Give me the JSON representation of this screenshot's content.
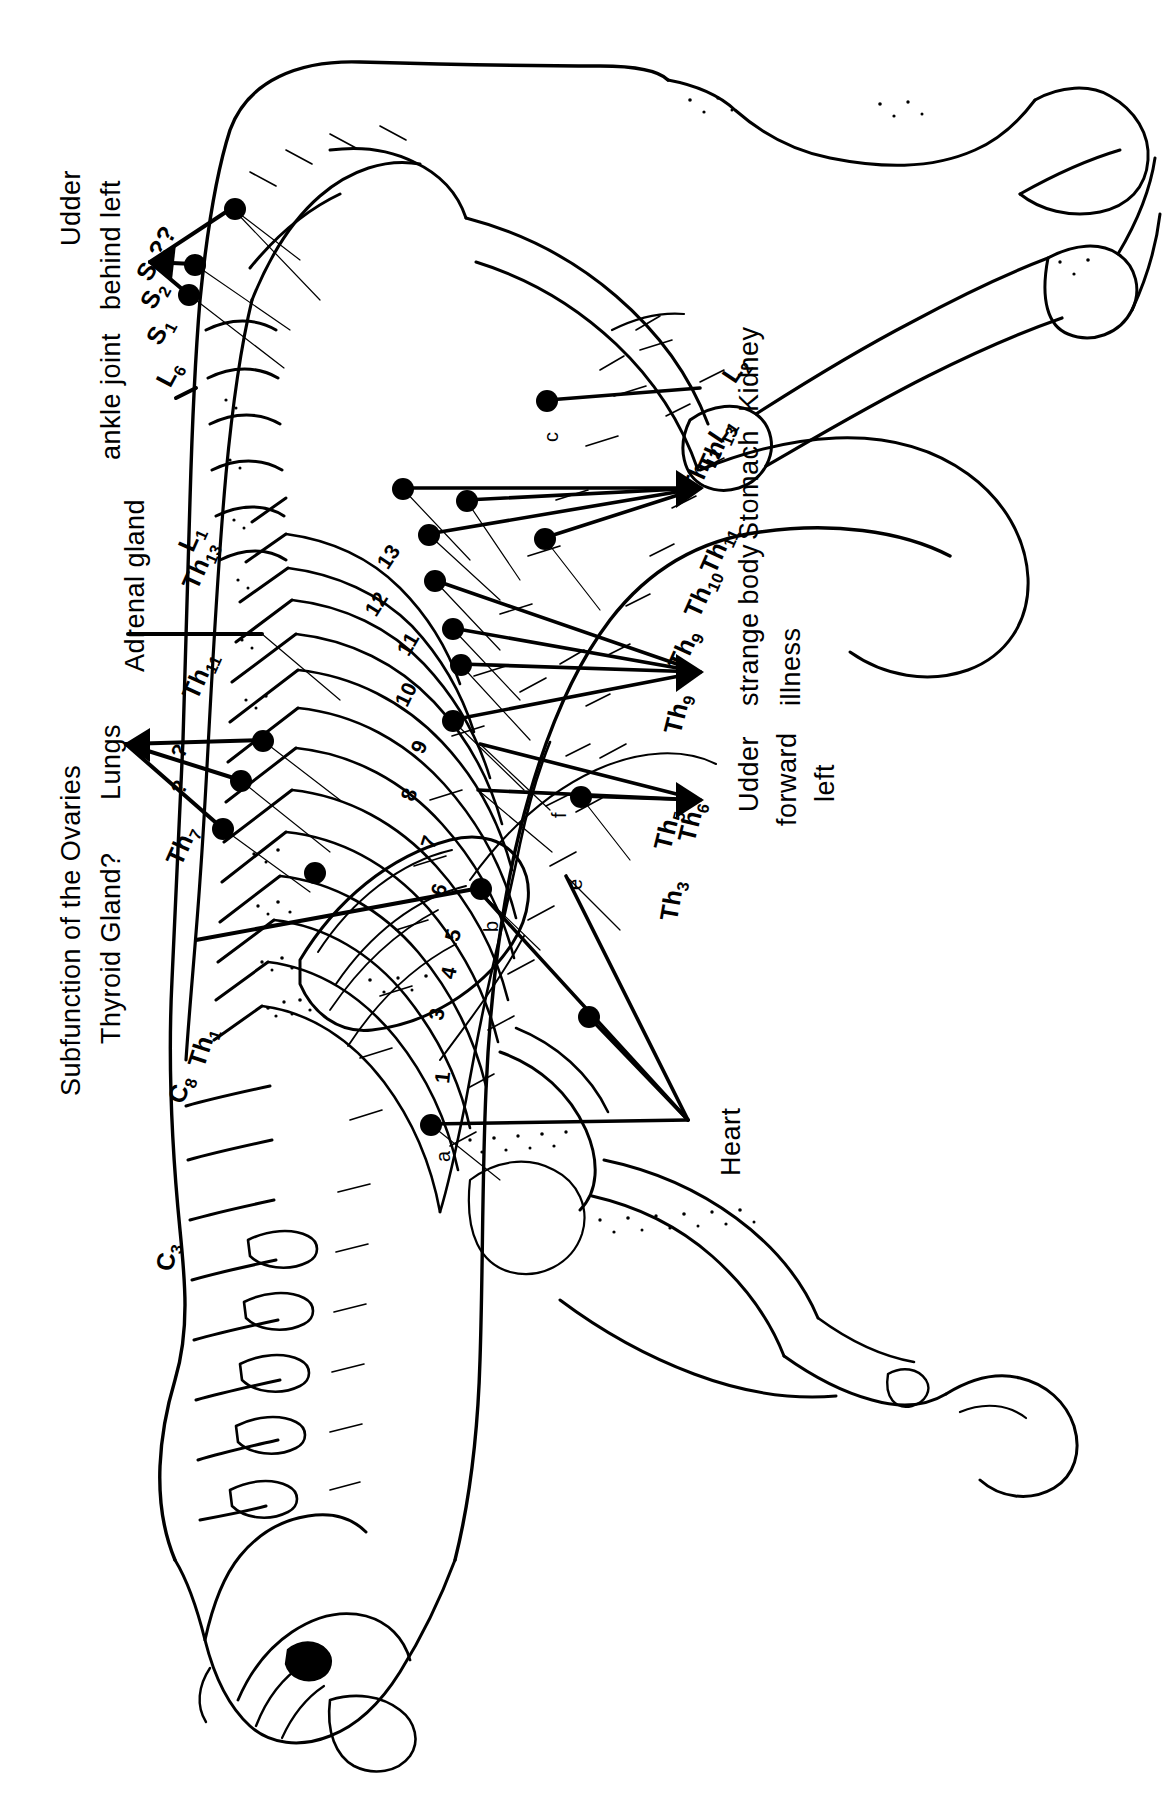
{
  "figure": {
    "orientation": "labels rotated 90 degrees counter-clockwise",
    "ink_color": "#000000",
    "background_color": "#ffffff"
  },
  "organ_labels": [
    {
      "id": "udder-behind-left",
      "text": "Udder\nbehind  left",
      "line1": "Udder",
      "line2": "behind  left"
    },
    {
      "id": "ankle-joint",
      "text": "ankle joint"
    },
    {
      "id": "adrenal-gland",
      "text": "Adrenal gland"
    },
    {
      "id": "lungs",
      "text": "Lungs"
    },
    {
      "id": "subfunction-ovaries",
      "text": "Subfunction of the Ovaries"
    },
    {
      "id": "thyroid-gland",
      "text": "Thyroid Gland?"
    },
    {
      "id": "kidney",
      "text": "Kidney"
    },
    {
      "id": "stomach",
      "text": "Stomach"
    },
    {
      "id": "strange-body",
      "text": "strange body"
    },
    {
      "id": "illness",
      "text": "illness"
    },
    {
      "id": "udder-forward",
      "text": "Udder"
    },
    {
      "id": "forward",
      "text": "forward"
    },
    {
      "id": "left",
      "text": "left"
    },
    {
      "id": "heart",
      "text": "Heart"
    }
  ],
  "segment_labels": [
    {
      "id": "c3",
      "base": "C",
      "sub": "3"
    },
    {
      "id": "c8",
      "base": "C",
      "sub": "8"
    },
    {
      "id": "th1",
      "base": "Th",
      "sub": "1"
    },
    {
      "id": "th3",
      "base": "Th",
      "sub": "3"
    },
    {
      "id": "th4",
      "base": "Th",
      "sub": "4"
    },
    {
      "id": "th5",
      "base": "Th",
      "sub": "5"
    },
    {
      "id": "th6",
      "base": "Th",
      "sub": "6"
    },
    {
      "id": "th7",
      "base": "Th",
      "sub": "7"
    },
    {
      "id": "th9",
      "base": "Th",
      "sub": "9"
    },
    {
      "id": "th10",
      "base": "Th",
      "sub": "10"
    },
    {
      "id": "th11",
      "base": "Th",
      "sub": "11"
    },
    {
      "id": "th11b",
      "base": "Th",
      "sub": "11"
    },
    {
      "id": "th12",
      "base": "Th",
      "sub": "12"
    },
    {
      "id": "th13",
      "base": "Th",
      "sub": "13"
    },
    {
      "id": "th13b",
      "base": "Th",
      "sub": "13"
    },
    {
      "id": "l1",
      "base": "L",
      "sub": "1"
    },
    {
      "id": "l1b",
      "base": "L",
      "sub": "1"
    },
    {
      "id": "l2",
      "base": "L",
      "sub": "2"
    },
    {
      "id": "l6",
      "base": "L",
      "sub": "6"
    },
    {
      "id": "s1",
      "base": "S",
      "sub": "1"
    },
    {
      "id": "s2",
      "base": "S",
      "sub": "2"
    },
    {
      "id": "s3",
      "base": "S",
      "sub": "3"
    }
  ],
  "rib_numbers": [
    "1",
    "3",
    "4",
    "5",
    "6",
    "7",
    "8",
    "9",
    "10",
    "11",
    "12",
    "13"
  ],
  "point_markers": [
    "a",
    "b",
    "c",
    "e",
    "f"
  ],
  "query_markers": [
    "?",
    "?",
    "??",
    "3??"
  ],
  "counts": {
    "reference_dots": 20,
    "organ_labels": 11,
    "segment_labels": 22
  }
}
